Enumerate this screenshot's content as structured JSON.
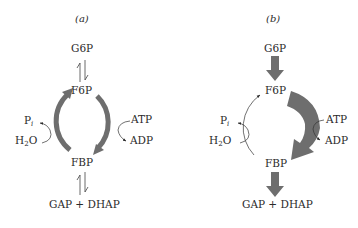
{
  "panels": [
    {
      "id": "a",
      "label": "(a)",
      "nodes": {
        "top": "G6P",
        "upper": "F6P",
        "lower": "FBP",
        "bottom": "GAP + DHAP"
      },
      "left_reaction": {
        "product": "P",
        "product_sub": "i",
        "reactant": "H",
        "reactant_sub": "2",
        "reactant_tail": "O"
      },
      "right_reaction": {
        "reactant": "ATP",
        "product": "ADP"
      },
      "description": "Balanced cycle: reversible G6P<->F6P and FBP<->GAP+DHAP, thick gray arcs on both sides"
    },
    {
      "id": "b",
      "label": "(b)",
      "nodes": {
        "top": "G6P",
        "upper": "F6P",
        "lower": "FBP",
        "bottom": "GAP + DHAP"
      },
      "left_reaction": {
        "product": "P",
        "product_sub": "i",
        "reactant": "H",
        "reactant_sub": "2",
        "reactant_tail": "O"
      },
      "right_reaction": {
        "reactant": "ATP",
        "product": "ADP"
      },
      "description": "Net glycolytic flux: large gray arrows G6P->F6P, F6P->FBP (right), FBP->GAP+DHAP; thin left arc"
    }
  ],
  "colors": {
    "arrow_gray": "#6e6e6e",
    "line": "#333333",
    "text": "#2a2a2a"
  }
}
